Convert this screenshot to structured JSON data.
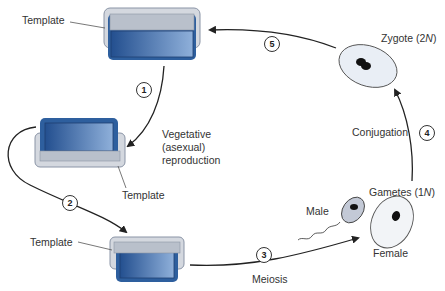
{
  "labels": {
    "template_top": "Template",
    "template_mid": "Template",
    "template_bottom": "Template",
    "vegetative_line1": "Vegetative",
    "vegetative_line2": "(asexual)",
    "vegetative_line3": "reproduction",
    "zygote": "Zygote (2",
    "zygote_n": "N",
    "zygote_close": ")",
    "conjugation": "Conjugation",
    "gametes": "Gametes (1",
    "gametes_n": "N",
    "gametes_close": ")",
    "male": "Male",
    "female": "Female",
    "meiosis": "Meiosis"
  },
  "steps": [
    "1",
    "2",
    "3",
    "4",
    "5"
  ],
  "colors": {
    "blue_dark": "#2e5f9e",
    "blue_light": "#c9d6ea",
    "template_gray": "#c8ccd4",
    "cell_fill": "#e9eef5",
    "male_fill": "#c3c9d6",
    "nucleus": "#111111",
    "arrow": "#222222"
  }
}
